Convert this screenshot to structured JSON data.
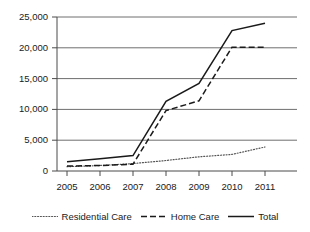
{
  "chart_data": {
    "type": "line",
    "title": "",
    "xlabel": "",
    "ylabel": "",
    "categories": [
      "2005",
      "2006",
      "2007",
      "2008",
      "2009",
      "2010",
      "2011"
    ],
    "x": [
      2005,
      2006,
      2007,
      2008,
      2009,
      2010,
      2011
    ],
    "ylim": [
      0,
      25000
    ],
    "yticks": [
      0,
      5000,
      10000,
      15000,
      20000,
      25000
    ],
    "ytick_labels": [
      "0",
      "5,000",
      "10,000",
      "15,000",
      "20,000",
      "25,000"
    ],
    "grid": "horizontal",
    "legend_position": "bottom",
    "series": [
      {
        "name": "Residential Care",
        "style": "dotted",
        "color": "#555555",
        "values": [
          700,
          900,
          1200,
          1700,
          2300,
          2700,
          3900
        ]
      },
      {
        "name": "Home Care",
        "style": "dashed",
        "color": "#1a1a1a",
        "values": [
          800,
          900,
          1100,
          9800,
          11400,
          20100,
          20100
        ]
      },
      {
        "name": "Total",
        "style": "solid",
        "color": "#1a1a1a",
        "values": [
          1500,
          2000,
          2500,
          11300,
          14200,
          22800,
          24000
        ]
      }
    ]
  },
  "axis": {
    "ytick_labels": [
      "25,000",
      "20,000",
      "15,000",
      "10,000",
      "5,000",
      "0"
    ],
    "xtick_labels": [
      "2005",
      "2006",
      "2007",
      "2008",
      "2009",
      "2010",
      "2011"
    ]
  },
  "legend": {
    "items": [
      {
        "label": "Residential Care",
        "style": "dotted"
      },
      {
        "label": "Home Care",
        "style": "dashed"
      },
      {
        "label": "Total",
        "style": "solid"
      }
    ]
  }
}
